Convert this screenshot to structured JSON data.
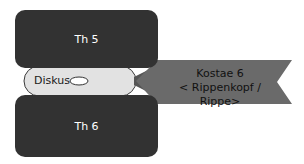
{
  "diagram": {
    "vertebra_top": {
      "label": "Th 5"
    },
    "vertebra_bottom": {
      "label": "Th 6"
    },
    "disc": {
      "label": "Diskus"
    },
    "callout": {
      "line1": "Kostae 6",
      "line2": "< Rippenkopf / Rippe>"
    }
  },
  "colors": {
    "vertebra": "#323232",
    "disc": "#e2e2e2",
    "callout": "#6a6a6a",
    "text_dark": "#1a1a1a",
    "text_light": "#ffffff"
  }
}
